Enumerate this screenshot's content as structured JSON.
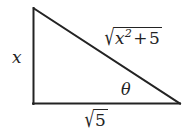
{
  "figure": {
    "type": "right-triangle-diagram",
    "background_color": "#ffffff",
    "stroke_color": "#232323",
    "stroke_width": 2
  },
  "geometry": {
    "vertices": {
      "top_left": {
        "x": 33,
        "y": 8
      },
      "bottom_left": {
        "x": 33,
        "y": 104
      },
      "bottom_right": {
        "x": 180,
        "y": 104
      }
    },
    "right_angle_at": "bottom_left"
  },
  "labels": {
    "vertical_leg": {
      "text": "x",
      "variable": "x",
      "side": "opposite"
    },
    "base": {
      "radicand": "5",
      "text": "√5",
      "side": "adjacent"
    },
    "hypotenuse": {
      "base_variable": "x",
      "exponent": "2",
      "operator": "+",
      "constant": "5",
      "text": "√(x² + 5)",
      "side": "hypotenuse"
    },
    "angle": {
      "text": "θ",
      "symbol": "theta",
      "location": "bottom-right vertex"
    }
  }
}
